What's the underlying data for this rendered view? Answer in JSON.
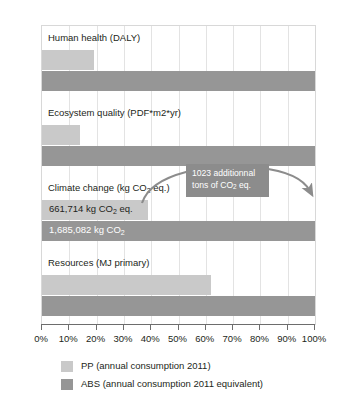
{
  "chart_data": {
    "type": "bar",
    "orientation": "horizontal",
    "title": "",
    "xlabel": "",
    "ylabel": "",
    "xlim": [
      0,
      100
    ],
    "xtick_labels": [
      "0%",
      "10%",
      "20%",
      "30%",
      "40%",
      "50%",
      "60%",
      "70%",
      "80%",
      "90%",
      "100%"
    ],
    "xtick_values": [
      0,
      10,
      20,
      30,
      40,
      50,
      60,
      70,
      80,
      90,
      100
    ],
    "grid": true,
    "grid_axis": "x",
    "legend_position": "bottom",
    "categories": [
      "Human health (DALY)",
      "Ecosystem quality (PDF*m2*yr)",
      "Climate change (kg CO2 eq.)",
      "Resources (MJ primary)"
    ],
    "series": [
      {
        "name": "PP (annual consumption 2011)",
        "color": "#c9c9c9",
        "values": [
          19,
          14,
          39,
          62
        ]
      },
      {
        "name": "ABS (annual consumption 2011 equivalent)",
        "color": "#969696",
        "values": [
          100,
          100,
          100,
          100
        ]
      }
    ],
    "annotations": [
      {
        "text_line_1": "1023 additionnal",
        "text_line_2": "tons of CO2 eq.",
        "type": "callout-with-curved-arrow",
        "from_percent": 39,
        "to_percent": 100,
        "attached_category": "Climate change (kg CO2 eq.)"
      }
    ]
  },
  "categories": [
    {
      "label_prefix": "Human health (DALY)",
      "label_sub": "",
      "label_suffix": "",
      "pp_value": 19,
      "abs_value": 100,
      "pp_data_label": "",
      "abs_data_label": ""
    },
    {
      "label_prefix": "Ecosystem quality (PDF*m2*yr)",
      "label_sub": "",
      "label_suffix": "",
      "pp_value": 14,
      "abs_value": 100,
      "pp_data_label": "",
      "abs_data_label": ""
    },
    {
      "label_prefix": "Climate change (kg CO",
      "label_sub": "2",
      "label_suffix": " eq.)",
      "pp_value": 39,
      "abs_value": 100,
      "pp_data_label_prefix": "661,714 kg CO",
      "pp_data_label_sub": "2",
      "pp_data_label_suffix": " eq.",
      "abs_data_label_prefix": "1,685,082 kg CO",
      "abs_data_label_sub": "2",
      "abs_data_label_suffix": ""
    },
    {
      "label_prefix": "Resources (MJ primary)",
      "label_sub": "",
      "label_suffix": "",
      "pp_value": 62,
      "abs_value": 100,
      "pp_data_label": "",
      "abs_data_label": ""
    }
  ],
  "annotation": {
    "line_1": "1023 additionnal",
    "line_2_prefix": "tons of CO",
    "line_2_sub": "2",
    "line_2_suffix": " eq."
  },
  "axis": {
    "ticks": [
      "0%",
      "10%",
      "20%",
      "30%",
      "40%",
      "50%",
      "60%",
      "70%",
      "80%",
      "90%",
      "100%"
    ]
  },
  "legend": {
    "items": [
      {
        "label": "PP (annual consumption 2011)",
        "color": "#c9c9c9"
      },
      {
        "label": "ABS (annual consumption 2011 equivalent)",
        "color": "#969696"
      }
    ]
  },
  "colors": {
    "pp": "#c9c9c9",
    "abs": "#969696",
    "callout_bg": "#8c8c8c",
    "grid": "#e3e3e3",
    "axis": "#6d6d6d",
    "text": "#231f20"
  }
}
